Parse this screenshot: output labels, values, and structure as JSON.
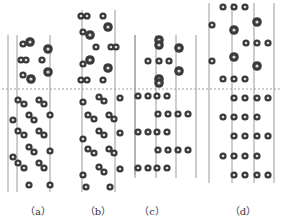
{
  "figure": {
    "interface_line_y": 89,
    "colors": {
      "line": "#9a9a9a",
      "atom_outer": "#3a3a3a",
      "atom_inner": "#dcdcdc",
      "dash": "#888888"
    },
    "panels": [
      {
        "id": "a",
        "label": "（a）",
        "label_x": 38,
        "lines": [
          {
            "x": 8,
            "y1": 35,
            "y2": 192
          },
          {
            "x": 17,
            "y1": 35,
            "y2": 192
          },
          {
            "x": 50,
            "y1": 35,
            "y2": 192
          }
        ],
        "atoms_large": [
          [
            30,
            42
          ],
          [
            48,
            49
          ],
          [
            48,
            72
          ],
          [
            31,
            79
          ]
        ],
        "atoms_small": [
          [
            23,
            44
          ],
          [
            21,
            60
          ],
          [
            26,
            60
          ],
          [
            42,
            60
          ],
          [
            23,
            75
          ],
          [
            18,
            100
          ],
          [
            24,
            104
          ],
          [
            39,
            100
          ],
          [
            44,
            104
          ],
          [
            13,
            120
          ],
          [
            29,
            115
          ],
          [
            34,
            120
          ],
          [
            50,
            115
          ],
          [
            18,
            131
          ],
          [
            24,
            135
          ],
          [
            39,
            131
          ],
          [
            44,
            135
          ],
          [
            29,
            147
          ],
          [
            34,
            152
          ],
          [
            50,
            151
          ],
          [
            13,
            157
          ],
          [
            18,
            163
          ],
          [
            24,
            168
          ],
          [
            39,
            163
          ],
          [
            44,
            168
          ],
          [
            29,
            185
          ],
          [
            50,
            185
          ]
        ]
      },
      {
        "id": "b",
        "label": "（b）",
        "label_x": 98,
        "lines": [
          {
            "x": 82,
            "y1": 10,
            "y2": 192
          },
          {
            "x": 115,
            "y1": 10,
            "y2": 192
          },
          {
            "x": 135,
            "y1": 35,
            "y2": 175
          }
        ],
        "atoms_large": [
          [
            108,
            27
          ],
          [
            90,
            35
          ],
          [
            90,
            60
          ],
          [
            108,
            68
          ]
        ],
        "atoms_small": [
          [
            81,
            16
          ],
          [
            87,
            16
          ],
          [
            103,
            16
          ],
          [
            83,
            32
          ],
          [
            96,
            47
          ],
          [
            111,
            47
          ],
          [
            116,
            47
          ],
          [
            83,
            64
          ],
          [
            81,
            80
          ],
          [
            87,
            80
          ],
          [
            103,
            80
          ],
          [
            83,
            102
          ],
          [
            99,
            97
          ],
          [
            104,
            101
          ],
          [
            120,
            98
          ],
          [
            88,
            115
          ],
          [
            94,
            119
          ],
          [
            109,
            115
          ],
          [
            114,
            119
          ],
          [
            83,
            139
          ],
          [
            99,
            131
          ],
          [
            104,
            135
          ],
          [
            120,
            133
          ],
          [
            88,
            149
          ],
          [
            94,
            153
          ],
          [
            109,
            149
          ],
          [
            114,
            153
          ],
          [
            120,
            169
          ],
          [
            83,
            175
          ],
          [
            99,
            167
          ],
          [
            104,
            172
          ],
          [
            86,
            187
          ],
          [
            110,
            187
          ]
        ]
      },
      {
        "id": "c",
        "label": "（c）",
        "label_x": 152,
        "lines": [
          {
            "x": 135,
            "y1": 35,
            "y2": 178
          },
          {
            "x": 156,
            "y1": 35,
            "y2": 178
          },
          {
            "x": 176,
            "y1": 35,
            "y2": 178
          },
          {
            "x": 196,
            "y1": 35,
            "y2": 178
          }
        ],
        "atoms_large": [
          [
            159,
            40
          ],
          [
            159,
            45
          ],
          [
            179,
            48
          ],
          [
            179,
            71
          ],
          [
            159,
            79
          ],
          [
            159,
            83
          ]
        ],
        "atoms_small": [
          [
            148,
            61
          ],
          [
            159,
            61
          ],
          [
            169,
            61
          ],
          [
            138,
            96
          ],
          [
            148,
            96
          ],
          [
            157,
            96
          ],
          [
            167,
            96
          ],
          [
            158,
            114
          ],
          [
            168,
            114
          ],
          [
            178,
            114
          ],
          [
            188,
            114
          ],
          [
            138,
            132
          ],
          [
            148,
            132
          ],
          [
            157,
            132
          ],
          [
            167,
            132
          ],
          [
            158,
            150
          ],
          [
            168,
            150
          ],
          [
            178,
            150
          ],
          [
            188,
            150
          ],
          [
            138,
            168
          ],
          [
            148,
            168
          ],
          [
            157,
            168
          ],
          [
            167,
            168
          ]
        ]
      },
      {
        "id": "d",
        "label": "（d）",
        "label_x": 243,
        "lines": [
          {
            "x": 209,
            "y1": 3,
            "y2": 183
          },
          {
            "x": 232,
            "y1": 3,
            "y2": 183
          },
          {
            "x": 254,
            "y1": 3,
            "y2": 183
          },
          {
            "x": 274,
            "y1": 3,
            "y2": 183
          }
        ],
        "atoms_large": [
          [
            257,
            22
          ],
          [
            234,
            30
          ],
          [
            234,
            57
          ],
          [
            257,
            66
          ]
        ],
        "atoms_small": [
          [
            223,
            7
          ],
          [
            234,
            7
          ],
          [
            245,
            7
          ],
          [
            212,
            25
          ],
          [
            246,
            43
          ],
          [
            257,
            43
          ],
          [
            268,
            43
          ],
          [
            212,
            61
          ],
          [
            223,
            79
          ],
          [
            234,
            79
          ],
          [
            245,
            79
          ],
          [
            234,
            98
          ],
          [
            245,
            98
          ],
          [
            257,
            98
          ],
          [
            268,
            98
          ],
          [
            223,
            117
          ],
          [
            234,
            117
          ],
          [
            245,
            117
          ],
          [
            257,
            117
          ],
          [
            234,
            136
          ],
          [
            245,
            136
          ],
          [
            257,
            136
          ],
          [
            268,
            136
          ],
          [
            223,
            156
          ],
          [
            234,
            156
          ],
          [
            245,
            156
          ],
          [
            257,
            156
          ],
          [
            234,
            175
          ],
          [
            245,
            175
          ],
          [
            257,
            175
          ],
          [
            268,
            175
          ]
        ]
      }
    ]
  }
}
